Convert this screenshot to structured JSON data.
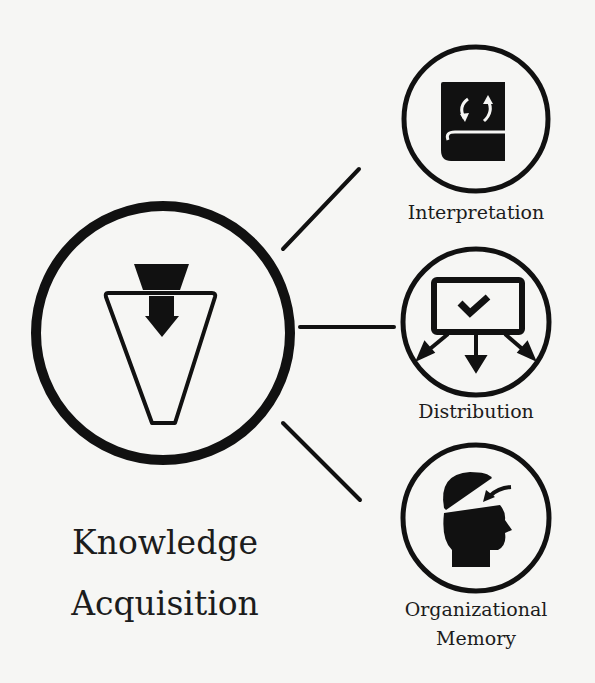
{
  "diagram": {
    "colors": {
      "stroke": "#111111",
      "background": "#f6f6f4",
      "text": "#1c1c1c"
    },
    "main_node": {
      "label_line1": "Knowledge",
      "label_line2": "Acquisition",
      "icon": "funnel-arrow-icon"
    },
    "nodes": [
      {
        "id": "interpretation",
        "label": "Interpretation",
        "icon": "book-refresh-icon"
      },
      {
        "id": "distribution",
        "label": "Distribution",
        "icon": "board-check-distribute-icon"
      },
      {
        "id": "organizational-memory",
        "label_line1": "Organizational",
        "label_line2": "Memory",
        "icon": "head-memory-icon"
      }
    ],
    "edges": [
      {
        "from": "knowledge-acquisition",
        "to": "interpretation"
      },
      {
        "from": "knowledge-acquisition",
        "to": "distribution"
      },
      {
        "from": "knowledge-acquisition",
        "to": "organizational-memory"
      }
    ]
  }
}
